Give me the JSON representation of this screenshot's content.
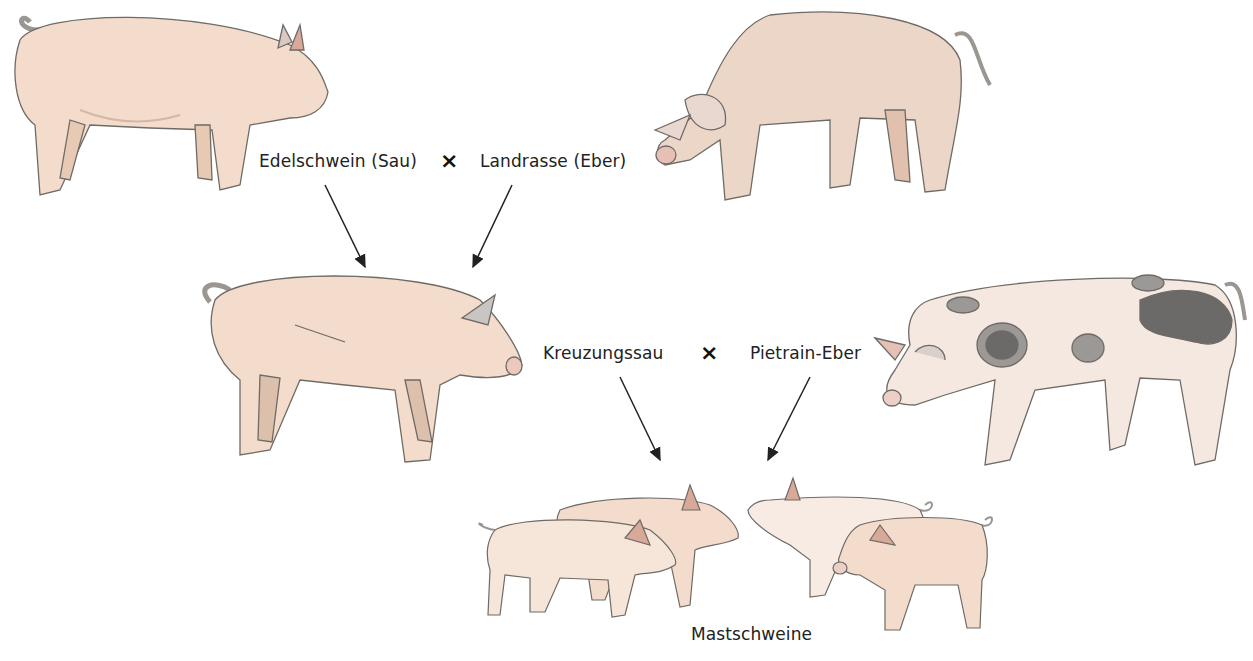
{
  "diagram": {
    "type": "breeding-cross",
    "generation1": {
      "female": {
        "label": "Edelschwein (Sau)",
        "icon": "white-pig-sow"
      },
      "male": {
        "label": "Landrasse (Eber)",
        "icon": "landrace-pig-boar"
      },
      "cross_symbol": "×"
    },
    "generation2": {
      "female": {
        "label": "Kreuzungssau",
        "icon": "crossbred-sow"
      },
      "male": {
        "label": "Pietrain-Eber",
        "icon": "spotted-pietrain-boar"
      },
      "cross_symbol": "×"
    },
    "offspring": {
      "label": "Mastschweine",
      "icon": "piglets-group"
    },
    "colors": {
      "pig_body": "#f3dccb",
      "pig_shade": "#e8c9b3",
      "outline": "#6e6a66",
      "spots_dark": "#6c6a68",
      "spots_light": "#9c9896",
      "arrow": "#222222",
      "text": "#222222"
    }
  }
}
